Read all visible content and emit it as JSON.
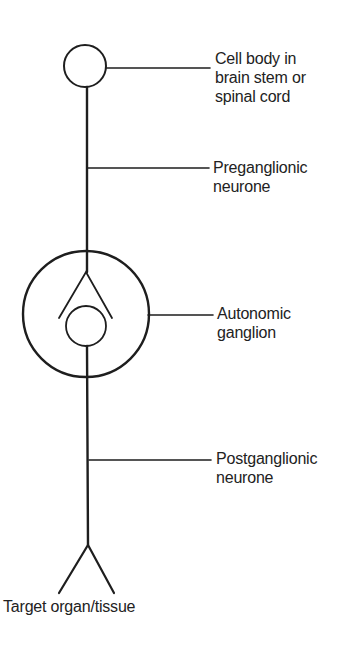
{
  "diagram": {
    "type": "autonomic-pathway",
    "labels": {
      "cell_body": [
        "Cell body in",
        "brain stem or",
        "spinal cord"
      ],
      "preganglionic": [
        "Preganglionic",
        "neurone"
      ],
      "ganglion": [
        "Autonomic",
        "ganglion"
      ],
      "postganglionic": [
        "Postganglionic",
        "neurone"
      ],
      "target": "Target organ/tissue"
    },
    "colors": {
      "line": "#1e1e1e",
      "background": "#ffffff"
    }
  }
}
